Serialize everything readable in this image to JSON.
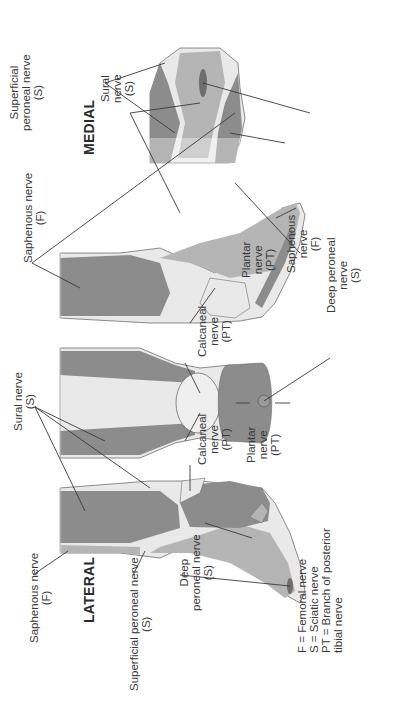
{
  "diagram": {
    "views": {
      "lateral": {
        "title": "LATERAL"
      },
      "posterior": {
        "title": ""
      },
      "medial": {
        "title": "MEDIAL"
      },
      "dorsal": {
        "title": ""
      }
    },
    "labels": {
      "lateral_saphenous": {
        "line1": "Saphenous nerve",
        "line2": "(F)"
      },
      "lateral_superficial_peroneal": {
        "line1": "Superficial peroneal nerve",
        "line2": "(S)"
      },
      "lateral_deep_peroneal": {
        "line1": "Deep",
        "line2": "peroneal nerve",
        "line3": "(S)"
      },
      "sural_top": {
        "line1": "Sural nerve",
        "line2": "(S)"
      },
      "calcaneal_left": {
        "line1": "Calcaneal",
        "line2": "nerve",
        "line3": "(PT)"
      },
      "plantar_left": {
        "line1": "Plantar",
        "line2": "nerve",
        "line3": "(PT)"
      },
      "calcaneal_right": {
        "line1": "Calcaneal",
        "line2": "nerve",
        "line3": "(PT)"
      },
      "plantar_right": {
        "line1": "Plantar",
        "line2": "nerve",
        "line3": "(PT)"
      },
      "medial_saphenous": {
        "line1": "Saphenous nerve",
        "line2": "(F)"
      },
      "medial_superficial_peroneal": {
        "line1": "Superficial",
        "line2": "peroneal nerve",
        "line3": "(S)"
      },
      "dorsal_sural": {
        "line1": "Sural",
        "line2": "nerve",
        "line3": "(S)"
      },
      "dorsal_saphenous": {
        "line1": "Saphenous",
        "line2": "nerve",
        "line3": "(F)"
      },
      "dorsal_deep_peroneal": {
        "line1": "Deep peroneal",
        "line2": "nerve",
        "line3": "(S)"
      }
    },
    "legend": [
      "F = Femoral nerve",
      "S = Sciatic nerve",
      "PT = Branch of posterior",
      "tibial nerve"
    ],
    "colors": {
      "dark_region": "#8c8c8c",
      "mid_region": "#b5b5b5",
      "light_region": "#e9e9e9",
      "outline": "#6e6e6e",
      "leader_line": "#3a3a3a",
      "text": "#3a3a3a"
    },
    "rotation_deg": -90
  }
}
